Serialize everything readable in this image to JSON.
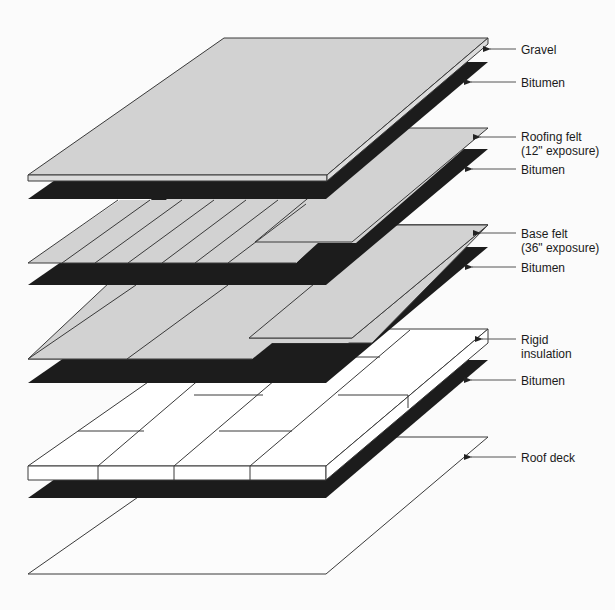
{
  "diagram": {
    "type": "exploded-layer-diagram",
    "colors": {
      "background": "#fbfbfb",
      "felt_gray": "#d2d2d2",
      "bitumen_black": "#1c1c1c",
      "insulation_white": "#ffffff",
      "outline": "#3a3a3a",
      "leader": "#555555"
    },
    "layers": [
      {
        "id": "gravel",
        "label": "Gravel",
        "label_y": 43
      },
      {
        "id": "bitumen-1",
        "label": "Bitumen",
        "label_y": 76
      },
      {
        "id": "roofing-felt",
        "label": "Roofing felt",
        "sublabel": "(12\" exposure)",
        "label_y": 130
      },
      {
        "id": "bitumen-2",
        "label": "Bitumen",
        "label_y": 163
      },
      {
        "id": "base-felt",
        "label": "Base felt",
        "sublabel": "(36\" exposure)",
        "label_y": 227
      },
      {
        "id": "bitumen-3",
        "label": "Bitumen",
        "label_y": 261
      },
      {
        "id": "rigid-insulation",
        "label": "Rigid",
        "sublabel": "insulation",
        "label_y": 333
      },
      {
        "id": "bitumen-4",
        "label": "Bitumen",
        "label_y": 374
      },
      {
        "id": "roof-deck",
        "label": "Roof deck",
        "label_y": 451
      }
    ]
  }
}
